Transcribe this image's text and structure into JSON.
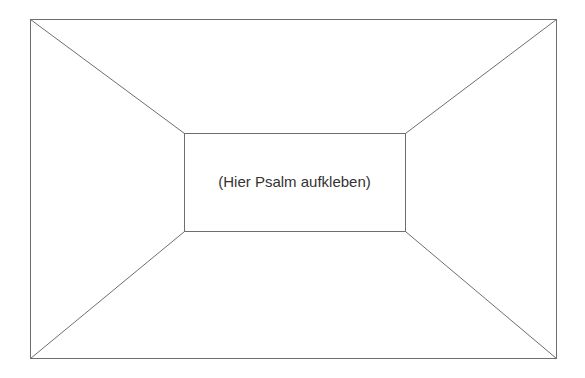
{
  "document": {
    "placeholder_text": "(Hier Psalm aufkleben)"
  },
  "frame": {
    "outer": {
      "x1": 30,
      "y1": 19,
      "x2": 556,
      "y2": 358
    },
    "inner": {
      "x1": 184,
      "y1": 133,
      "x2": 405,
      "y2": 231
    },
    "stroke_color": "#6e6e6e"
  }
}
